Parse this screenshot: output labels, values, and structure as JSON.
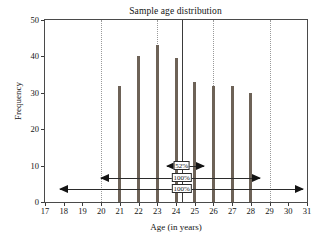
{
  "chart_data": {
    "type": "bar",
    "title": "Sample age distribution",
    "xlabel": "Age (in years)",
    "ylabel": "Frequency",
    "categories": [
      17,
      18,
      19,
      20,
      21,
      22,
      23,
      24,
      25,
      26,
      27,
      28,
      29,
      30,
      31
    ],
    "values": [
      0,
      0,
      0,
      0,
      32,
      40,
      43,
      39.5,
      33,
      32,
      32,
      30,
      0,
      0,
      0
    ],
    "xlim": [
      17,
      31
    ],
    "ylim": [
      0,
      50
    ],
    "xticks": [
      17,
      18,
      19,
      20,
      21,
      22,
      23,
      24,
      25,
      26,
      27,
      28,
      29,
      30,
      31
    ],
    "yticks": [
      0,
      10,
      20,
      30,
      40,
      50
    ],
    "xtick_labels": [
      "17",
      "18",
      "19",
      "20",
      "21",
      "22",
      "23",
      "24",
      "25",
      "26",
      "27",
      "28",
      "29",
      "30",
      "31"
    ],
    "ytick_labels": [
      "0",
      "10",
      "20",
      "30",
      "40",
      "50"
    ],
    "grid": "vertical-dotted",
    "gridlines_x": [
      20,
      23,
      26,
      29
    ],
    "legend": null,
    "bar_color": "#6d6257",
    "axis_color": "#3a3a3a",
    "grid_color": "#9a9a9a",
    "reference_line": {
      "name": "mean-line",
      "x": 24.3,
      "orientation": "vertical",
      "color": "#3a3a3a"
    },
    "annotations": [
      {
        "name": "interval-1-sigma",
        "label": "52%",
        "x_start": 23.5,
        "x_end": 25.5,
        "y": 10,
        "style": "double-headed-arrow"
      },
      {
        "name": "interval-2-sigma",
        "label": "100%",
        "x_start": 20.0,
        "x_end": 28.5,
        "y": 6.5,
        "style": "double-headed-arrow"
      },
      {
        "name": "interval-3-sigma",
        "label": "100%",
        "x_start": 17.8,
        "x_end": 30.8,
        "y": 3.5,
        "style": "double-headed-arrow"
      }
    ]
  }
}
